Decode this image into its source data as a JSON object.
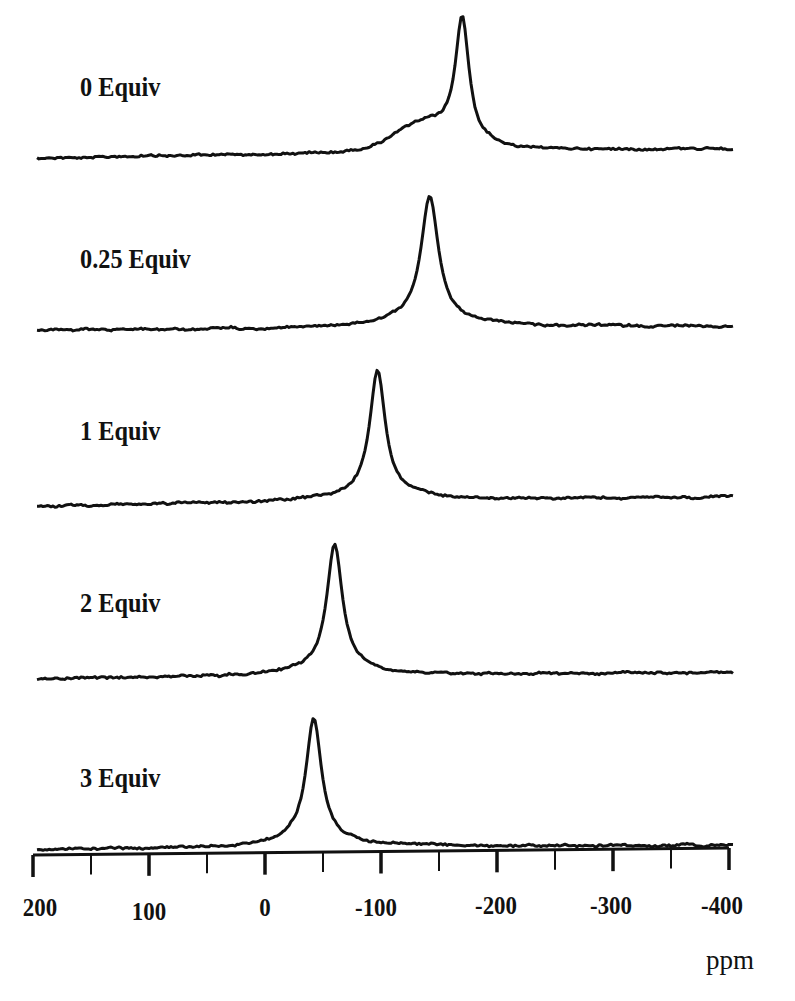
{
  "chart_data": {
    "type": "line",
    "title": "",
    "xlabel": "ppm",
    "ylabel": "",
    "xlim": [
      200,
      -400
    ],
    "x_reversed": true,
    "grid": false,
    "legend": "none (inline labels per trace)",
    "x_ticks_major": [
      200,
      100,
      0,
      -100,
      -200,
      -300,
      -400
    ],
    "x_tick_labels": [
      "200",
      "100",
      "0",
      "-100",
      "-200",
      "-300",
      "-400"
    ],
    "x_ticks_minor": [
      150,
      50,
      -50,
      -150,
      -250,
      -350
    ],
    "series": [
      {
        "name": "0 Equiv",
        "peak_ppm": -170,
        "half_width_ppm": 7,
        "relative_height": 1.0,
        "shoulder": {
          "ppm": -135,
          "height": 0.18,
          "width": 25
        }
      },
      {
        "name": "0.25 Equiv",
        "peak_ppm": -142,
        "half_width_ppm": 9,
        "relative_height": 1.0
      },
      {
        "name": "1 Equiv",
        "peak_ppm": -97,
        "half_width_ppm": 8,
        "relative_height": 1.0
      },
      {
        "name": "2 Equiv",
        "peak_ppm": -60,
        "half_width_ppm": 8,
        "relative_height": 1.0
      },
      {
        "name": "3 Equiv",
        "peak_ppm": -42,
        "half_width_ppm": 8,
        "relative_height": 1.0
      }
    ],
    "annotations": [
      "Stacked spectra; peak shifts downfield (toward 0 ppm) with increasing equivalents"
    ]
  },
  "labels": {
    "trace_0": "0 Equiv",
    "trace_1": "0.25 Equiv",
    "trace_2": "1 Equiv",
    "trace_3": "2 Equiv",
    "trace_4": "3 Equiv",
    "unit": "ppm"
  },
  "axis": {
    "tick_labels": [
      "200",
      "100",
      "0",
      "-100",
      "-200",
      "-300",
      "-400"
    ]
  },
  "colors": {
    "ink": "#111111",
    "background": "#ffffff"
  }
}
